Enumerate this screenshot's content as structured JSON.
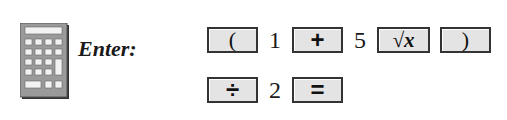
{
  "icon": {
    "name": "calculator-icon"
  },
  "instruction": {
    "label": "Enter:"
  },
  "keystrokes": {
    "row1": [
      {
        "type": "key",
        "label": "("
      },
      {
        "type": "digit",
        "label": "1"
      },
      {
        "type": "key",
        "label": "+"
      },
      {
        "type": "digit",
        "label": "5"
      },
      {
        "type": "key",
        "label": "√x"
      },
      {
        "type": "key",
        "label": ")"
      }
    ],
    "row2": [
      {
        "type": "key",
        "label": "÷"
      },
      {
        "type": "digit",
        "label": "2"
      },
      {
        "type": "key",
        "label": "="
      }
    ]
  },
  "colors": {
    "key_fill": "#e4e4e4",
    "key_border": "#333333",
    "icon_fill": "#9a9a9a"
  }
}
